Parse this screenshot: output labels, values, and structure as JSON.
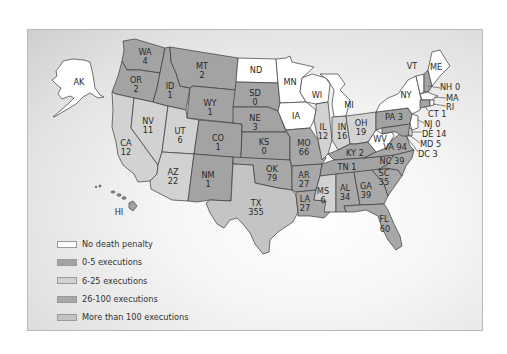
{
  "colors": {
    "none": "#ffffff",
    "c0_5": "#a3a3a3",
    "c6_25": "#d2d2d2",
    "c26_100": "#a8a8a8",
    "c100p": "#c4c4c4"
  },
  "legend": [
    {
      "key": "none",
      "label": "No death penalty"
    },
    {
      "key": "c0_5",
      "label": "0-5 executions"
    },
    {
      "key": "c6_25",
      "label": "6-25 executions"
    },
    {
      "key": "c26_100",
      "label": "26-100 executions"
    },
    {
      "key": "c100p",
      "label": "More than 100 executions"
    }
  ],
  "states": [
    {
      "abbr": "AK",
      "count": null,
      "category": "none"
    },
    {
      "abbr": "HI",
      "count": null,
      "category": "c0_5"
    },
    {
      "abbr": "WA",
      "count": "4",
      "category": "c0_5"
    },
    {
      "abbr": "OR",
      "count": "2",
      "category": "c0_5"
    },
    {
      "abbr": "CA",
      "count": "12",
      "category": "c6_25"
    },
    {
      "abbr": "NV",
      "count": "11",
      "category": "c6_25"
    },
    {
      "abbr": "ID",
      "count": "1",
      "category": "c0_5"
    },
    {
      "abbr": "MT",
      "count": "2",
      "category": "c0_5"
    },
    {
      "abbr": "WY",
      "count": "1",
      "category": "c0_5"
    },
    {
      "abbr": "UT",
      "count": "6",
      "category": "c6_25"
    },
    {
      "abbr": "AZ",
      "count": "22",
      "category": "c6_25"
    },
    {
      "abbr": "CO",
      "count": "1",
      "category": "c0_5"
    },
    {
      "abbr": "NM",
      "count": "1",
      "category": "c0_5"
    },
    {
      "abbr": "ND",
      "count": null,
      "category": "none"
    },
    {
      "abbr": "SD",
      "count": "0",
      "category": "c0_5"
    },
    {
      "abbr": "NE",
      "count": "3",
      "category": "c0_5"
    },
    {
      "abbr": "KS",
      "count": "0",
      "category": "c0_5"
    },
    {
      "abbr": "OK",
      "count": "79",
      "category": "c26_100"
    },
    {
      "abbr": "TX",
      "count": "355",
      "category": "c100p"
    },
    {
      "abbr": "MN",
      "count": null,
      "category": "none"
    },
    {
      "abbr": "IA",
      "count": null,
      "category": "none"
    },
    {
      "abbr": "MO",
      "count": "66",
      "category": "c26_100"
    },
    {
      "abbr": "AR",
      "count": "27",
      "category": "c26_100"
    },
    {
      "abbr": "LA",
      "count": "27",
      "category": "c26_100"
    },
    {
      "abbr": "WI",
      "count": null,
      "category": "none"
    },
    {
      "abbr": "IL",
      "count": "12",
      "category": "c6_25"
    },
    {
      "abbr": "MI",
      "count": null,
      "category": "none"
    },
    {
      "abbr": "IN",
      "count": "16",
      "category": "c6_25"
    },
    {
      "abbr": "OH",
      "count": "19",
      "category": "c6_25"
    },
    {
      "abbr": "KY",
      "count": "2",
      "category": "c0_5"
    },
    {
      "abbr": "TN",
      "count": "1",
      "category": "c0_5"
    },
    {
      "abbr": "MS",
      "count": "6",
      "category": "c6_25"
    },
    {
      "abbr": "AL",
      "count": "34",
      "category": "c26_100"
    },
    {
      "abbr": "GA",
      "count": "39",
      "category": "c26_100"
    },
    {
      "abbr": "FL",
      "count": "60",
      "category": "c26_100"
    },
    {
      "abbr": "SC",
      "count": "35",
      "category": "c26_100"
    },
    {
      "abbr": "NC",
      "count": "39",
      "category": "c26_100"
    },
    {
      "abbr": "VA",
      "count": "94",
      "category": "c26_100"
    },
    {
      "abbr": "WV",
      "count": null,
      "category": "none"
    },
    {
      "abbr": "PA",
      "count": "3",
      "category": "c0_5"
    },
    {
      "abbr": "NY",
      "count": null,
      "category": "none"
    },
    {
      "abbr": "VT",
      "count": null,
      "category": "none"
    },
    {
      "abbr": "ME",
      "count": null,
      "category": "none"
    },
    {
      "abbr": "NH",
      "count": "0",
      "category": "c0_5"
    },
    {
      "abbr": "MA",
      "count": null,
      "category": "none"
    },
    {
      "abbr": "RI",
      "count": null,
      "category": "none"
    },
    {
      "abbr": "CT",
      "count": "1",
      "category": "c0_5"
    },
    {
      "abbr": "NJ",
      "count": "0",
      "category": "c0_5"
    },
    {
      "abbr": "DE",
      "count": "14",
      "category": "c6_25"
    },
    {
      "abbr": "MD",
      "count": "5",
      "category": "c0_5"
    },
    {
      "abbr": "DC",
      "count": "3",
      "category": "c0_5"
    }
  ],
  "labels": {
    "AK": "AK",
    "HI": "HI",
    "WA": "WA",
    "WA_n": "4",
    "OR": "OR",
    "OR_n": "2",
    "CA": "CA",
    "CA_n": "12",
    "NV": "NV",
    "NV_n": "11",
    "ID": "ID",
    "ID_n": "1",
    "MT": "MT",
    "MT_n": "2",
    "WY": "WY",
    "WY_n": "1",
    "UT": "UT",
    "UT_n": "6",
    "AZ": "AZ",
    "AZ_n": "22",
    "CO": "CO",
    "CO_n": "1",
    "NM": "NM",
    "NM_n": "1",
    "ND": "ND",
    "SD": "SD",
    "SD_n": "0",
    "NE": "NE",
    "NE_n": "3",
    "KS": "KS",
    "KS_n": "0",
    "OK": "OK",
    "OK_n": "79",
    "TX": "TX",
    "TX_n": "355",
    "MN": "MN",
    "IA": "IA",
    "MO": "MO",
    "MO_n": "66",
    "AR": "AR",
    "AR_n": "27",
    "LA": "LA",
    "LA_n": "27",
    "WI": "WI",
    "IL": "IL",
    "IL_n": "12",
    "MI": "MI",
    "IN": "IN",
    "IN_n": "16",
    "OH": "OH",
    "OH_n": "19",
    "KY": "KY 2",
    "TN": "TN 1",
    "MS": "MS",
    "MS_n": "6",
    "AL": "AL",
    "AL_n": "34",
    "GA": "GA",
    "GA_n": "39",
    "FL": "FL",
    "FL_n": "60",
    "SC": "SC",
    "SC_n": "35",
    "NC": "NC 39",
    "VA": "VA 94",
    "WV": "WV",
    "PA": "PA 3",
    "NY": "NY",
    "VT": "VT",
    "ME": "ME",
    "NH": "NH 0",
    "MA": "MA",
    "RI": "RI",
    "CT": "CT 1",
    "NJ": "NJ 0",
    "DE": "DE 14",
    "MD": "MD 5",
    "DC": "DC 3"
  }
}
